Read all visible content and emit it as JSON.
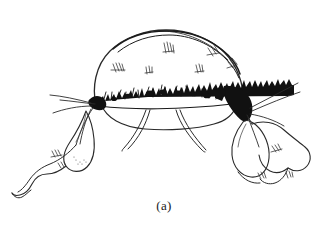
{
  "figure": {
    "caption": "(a)",
    "caption_x": 168,
    "caption_y": 200,
    "width": 328,
    "height": 239,
    "background_color": "#ffffff",
    "ink_color": "#111111",
    "line_color": "#2a2a2a",
    "hatch_color": "#3a3a3a"
  },
  "parts": {
    "dome": {
      "name": "dome-body",
      "label": "dome body"
    },
    "top_ridge": {
      "name": "top-ridge",
      "label": "top ridge double line"
    },
    "fringe_band": {
      "name": "fringe-band",
      "label": "jagged dark fringe band"
    },
    "right_black_wedge": {
      "name": "right-black-wedge",
      "label": "solid black wedge right"
    },
    "left_black_wedge": {
      "name": "left-black-wedge",
      "label": "solid black wedge left"
    },
    "left_palp": {
      "name": "left-palp-lobe",
      "label": "left rounded palp lobe"
    },
    "left_tail": {
      "name": "left-tail-lobe",
      "label": "left wavy tail lobe"
    },
    "right_palp_inner": {
      "name": "right-palp-inner-lobe",
      "label": "right inner palp lobe"
    },
    "right_palp_outer": {
      "name": "right-palp-outer-lobe",
      "label": "right outer palp lobe"
    },
    "center_setae": {
      "name": "center-setae",
      "label": "two slender center appendages"
    },
    "left_antennae": {
      "name": "left-antenna-lines",
      "label": "left radiating thin lines"
    },
    "right_antennae": {
      "name": "right-antenna-lines",
      "label": "right radiating thin lines"
    },
    "hatching": {
      "name": "surface-hatch-tufts",
      "label": "surface hatch tufts"
    }
  }
}
